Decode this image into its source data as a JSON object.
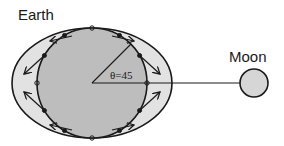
{
  "diagram": {
    "labels": {
      "earth": "Earth",
      "moon": "Moon",
      "angle": "θ=45"
    },
    "elements": {
      "earth_body": {
        "shape": "circle",
        "fill": "#bdbdbd"
      },
      "tidal_bulge": {
        "shape": "ellipse",
        "fill": "#e2e2e2",
        "elongated_toward": "moon"
      },
      "moon_body": {
        "shape": "circle",
        "fill": "#d6d6d6"
      },
      "earth_moon_line": {
        "from": "earth-center",
        "to": "moon-center"
      },
      "radius_line": {
        "angle_deg": 45
      },
      "surface_points": {
        "count": 12
      },
      "force_arrows": {
        "count": 8,
        "direction": "tidal-forces toward bulge ends"
      }
    },
    "colors": {
      "stroke": "#1a1a1a",
      "earth_fill": "#bdbdbd",
      "bulge_fill": "#e2e2e2",
      "moon_fill": "#d6d6d6"
    }
  }
}
